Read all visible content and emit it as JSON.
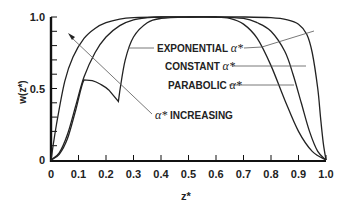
{
  "chart_data": {
    "type": "line",
    "title": "",
    "xlabel": "z*",
    "ylabel": "w(z*)",
    "xlim": [
      0,
      1.0
    ],
    "ylim": [
      0,
      1.0
    ],
    "grid": false,
    "x_ticks": [
      "0",
      "0.1",
      "0.2",
      "0.3",
      "0.4",
      "0.5",
      "0.6",
      "0.7",
      "0.8",
      "0.9",
      "1.0"
    ],
    "y_ticks": [
      "0",
      "0.5",
      "1.0"
    ],
    "series": [
      {
        "name": "EXPONENTIAL α*",
        "x": [
          0,
          0.02,
          0.05,
          0.08,
          0.12,
          0.16,
          0.2,
          0.25,
          0.3,
          0.4,
          0.5,
          0.6,
          0.7,
          0.8,
          0.86,
          0.9,
          0.93,
          0.95,
          0.97,
          0.98,
          0.99,
          1.0
        ],
        "values": [
          0,
          0.25,
          0.55,
          0.72,
          0.85,
          0.92,
          0.96,
          0.985,
          0.995,
          1.0,
          1.0,
          1.0,
          1.0,
          0.995,
          0.98,
          0.95,
          0.88,
          0.75,
          0.5,
          0.3,
          0.12,
          0
        ]
      },
      {
        "name": "CONSTANT α*",
        "x": [
          0,
          0.03,
          0.06,
          0.09,
          0.12,
          0.16,
          0.2,
          0.25,
          0.3,
          0.35,
          0.4,
          0.5,
          0.6,
          0.7,
          0.75,
          0.8,
          0.85,
          0.88,
          0.91,
          0.94,
          0.97,
          1.0
        ],
        "values": [
          0,
          0.05,
          0.18,
          0.38,
          0.58,
          0.75,
          0.86,
          0.94,
          0.98,
          0.995,
          1.0,
          1.0,
          1.0,
          0.99,
          0.96,
          0.9,
          0.76,
          0.6,
          0.4,
          0.2,
          0.06,
          0
        ]
      },
      {
        "name": "PARABOLIC α*",
        "x": [
          0,
          0.03,
          0.06,
          0.09,
          0.12,
          0.15,
          0.18,
          0.21,
          0.245,
          0.25,
          0.27,
          0.3,
          0.35,
          0.4,
          0.5,
          0.6,
          0.65,
          0.7,
          0.75,
          0.8,
          0.85,
          0.9,
          0.95,
          1.0
        ],
        "values": [
          0,
          0.04,
          0.15,
          0.35,
          0.56,
          0.555,
          0.53,
          0.49,
          0.41,
          0.48,
          0.7,
          0.86,
          0.96,
          0.99,
          1.0,
          1.0,
          0.99,
          0.95,
          0.85,
          0.66,
          0.42,
          0.2,
          0.06,
          0
        ]
      }
    ],
    "annotations": [
      {
        "text": "EXPONENTIAL",
        "greek": "α*"
      },
      {
        "text": "CONSTANT",
        "greek": "α*"
      },
      {
        "text": "PARABOLIC",
        "greek": "α*"
      },
      {
        "text": "INCREASING",
        "greek": "α*",
        "arrow": "points up-left toward curves"
      }
    ]
  },
  "labels": {
    "exponential": "EXPONENTIAL",
    "constant": "CONSTANT",
    "parabolic": "PARABOLIC",
    "increasing": "INCREASING",
    "alpha": "α*",
    "xlabel": "z*",
    "ylabel": "w(z*)"
  },
  "colors": {
    "line": "#222222",
    "leader": "#555555"
  }
}
